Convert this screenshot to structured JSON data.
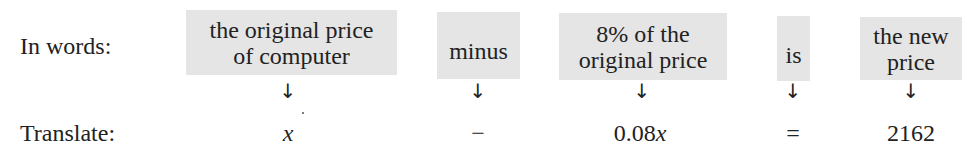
{
  "rows": {
    "words_label": "In words:",
    "translate_label": "Translate:"
  },
  "columns": [
    {
      "phrase_lines": [
        "the original price",
        "of computer"
      ],
      "arrow": "↓",
      "expression_prefix": "",
      "expression_italic": "x",
      "x_center": 288
    },
    {
      "phrase_lines": [
        "minus"
      ],
      "arrow": "↓",
      "expression_prefix": "−",
      "expression_italic": "",
      "x_center": 478
    },
    {
      "phrase_lines": [
        "8% of the",
        "original price"
      ],
      "arrow": "↓",
      "expression_prefix": "0.08",
      "expression_italic": "x",
      "x_center": 642
    },
    {
      "phrase_lines": [
        "is"
      ],
      "arrow": "↓",
      "expression_prefix": "=",
      "expression_italic": "",
      "x_center": 793
    },
    {
      "phrase_lines": [
        "the new",
        "price"
      ],
      "arrow": "↓",
      "expression_prefix": "2162",
      "expression_italic": "",
      "x_center": 911
    }
  ],
  "equation": "x − 0.08x = 2162",
  "colors": {
    "box_background": "#e5e5e5",
    "text": "#222222",
    "page_background": "#ffffff"
  }
}
